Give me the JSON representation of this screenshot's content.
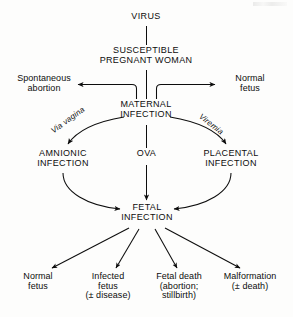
{
  "diagram": {
    "type": "flowchart",
    "ink_color": "#0d0d0d",
    "background_color": "#fdfdfc",
    "nodes": {
      "virus": "VIRUS",
      "susceptible_woman": "SUSCEPTIBLE\nPREGNANT WOMAN",
      "spontaneous_abortion": "Spontaneous\nabortion",
      "maternal_infection": "MATERNAL\nINFECTION",
      "normal_fetus_upper": "Normal\nfetus",
      "amnionic_infection": "AMNIONIC\nINFECTION",
      "ova": "OVA",
      "placental_infection": "PLACENTAL\nINFECTION",
      "fetal_infection": "FETAL\nINFECTION",
      "normal_fetus_lower": "Normal\nfetus",
      "infected_fetus": "Infected\nfetus\n(± disease)",
      "fetal_death": "Fetal death\n(abortion;\nstillbirth)",
      "malformation": "Malformation\n(± death)"
    },
    "edge_labels": {
      "via_vagina": "Via vagina",
      "viremia": "Viremia"
    },
    "flow": [
      {
        "from": "VIRUS",
        "to": "SUSCEPTIBLE PREGNANT WOMAN"
      },
      {
        "from": "SUSCEPTIBLE PREGNANT WOMAN",
        "to": "MATERNAL INFECTION"
      },
      {
        "from": "SUSCEPTIBLE PREGNANT WOMAN",
        "to": "Spontaneous abortion"
      },
      {
        "from": "SUSCEPTIBLE PREGNANT WOMAN",
        "to": "Normal fetus"
      },
      {
        "from": "MATERNAL INFECTION",
        "to": "AMNIONIC INFECTION",
        "label": "Via vagina"
      },
      {
        "from": "MATERNAL INFECTION",
        "to": "PLACENTAL INFECTION",
        "label": "Viremia"
      },
      {
        "from": "MATERNAL INFECTION",
        "to": "FETAL INFECTION",
        "label": "OVA"
      },
      {
        "from": "AMNIONIC INFECTION",
        "to": "FETAL INFECTION"
      },
      {
        "from": "PLACENTAL INFECTION",
        "to": "FETAL INFECTION"
      },
      {
        "from": "FETAL INFECTION",
        "to": "Normal fetus"
      },
      {
        "from": "FETAL INFECTION",
        "to": "Infected fetus (± disease)"
      },
      {
        "from": "FETAL INFECTION",
        "to": "Fetal death (abortion; stillbirth)"
      },
      {
        "from": "FETAL INFECTION",
        "to": "Malformation (± death)"
      }
    ]
  }
}
